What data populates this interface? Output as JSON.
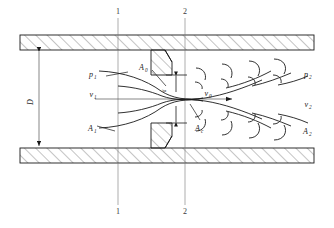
{
  "figure": {
    "type": "engineering-diagram"
  },
  "section_lines": {
    "line1": {
      "top_label": "1",
      "bottom_label": "1"
    },
    "line2": {
      "top_label": "2",
      "bottom_label": "2"
    }
  },
  "dimensions": {
    "pipe_diameter_label": "D",
    "pipe_diameter_sub": ""
  },
  "labels": {
    "p1": {
      "base": "p",
      "sub": "1"
    },
    "v1": {
      "base": "v",
      "sub": "1"
    },
    "A1": {
      "base": "A",
      "sub": "1"
    },
    "A0": {
      "base": "A",
      "sub": "0"
    },
    "v0": {
      "base": "v",
      "sub": "0"
    },
    "Ac": {
      "base": "A",
      "sub": "c"
    },
    "p2": {
      "base": "p",
      "sub": "2"
    },
    "v2": {
      "base": "v",
      "sub": "2"
    },
    "A2": {
      "base": "A",
      "sub": "2"
    },
    "d_orifice": {
      "base": "d",
      "sub": ""
    }
  },
  "colors": {
    "line": "#1a1a1a",
    "hatch": "#555555",
    "thin": "#777777",
    "background": "#ffffff"
  }
}
